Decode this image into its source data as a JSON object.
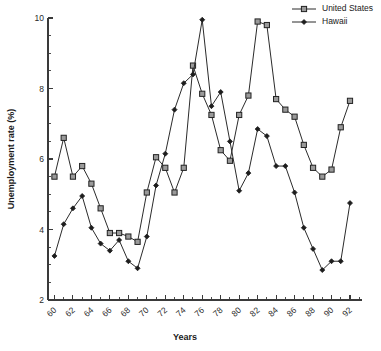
{
  "chart_data": {
    "type": "line",
    "title": "",
    "xlabel": "Years",
    "ylabel": "Unemployment rate (%)",
    "xlim": [
      59.3,
      93.3
    ],
    "ylim": [
      2,
      10
    ],
    "grid": false,
    "legend_position": "top-right",
    "y_ticks_major": [
      2,
      4,
      6,
      8,
      10
    ],
    "y_ticks_minor": [
      2.5,
      3,
      3.5,
      4.5,
      5,
      5.5,
      6.5,
      7,
      7.5,
      8.5,
      9,
      9.5
    ],
    "x_ticks_major": [
      60,
      62,
      64,
      66,
      68,
      70,
      72,
      74,
      76,
      78,
      80,
      82,
      84,
      86,
      88,
      90,
      92
    ],
    "x_ticks_minor": [
      61,
      63,
      65,
      67,
      69,
      71,
      73,
      75,
      77,
      79,
      81,
      83,
      85,
      87,
      89,
      91,
      93
    ],
    "x_tick_labels": [
      "60",
      "62",
      "64",
      "66",
      "68",
      "70",
      "72",
      "74",
      "76",
      "78",
      "80",
      "82",
      "84",
      "86",
      "88",
      "90",
      "92"
    ],
    "y_tick_labels": [
      "2",
      "4",
      "6",
      "8",
      "10"
    ],
    "x": [
      60,
      61,
      62,
      63,
      64,
      65,
      66,
      67,
      68,
      69,
      70,
      71,
      72,
      73,
      74,
      75,
      76,
      77,
      78,
      79,
      80,
      81,
      82,
      83,
      84,
      85,
      86,
      87,
      88,
      89,
      90,
      91,
      92,
      93
    ],
    "series": [
      {
        "name": "United States",
        "marker": "square",
        "marker_fill": "#9a9a9a",
        "color": "#2b2b2b",
        "values": [
          5.5,
          6.6,
          5.5,
          5.8,
          5.3,
          4.6,
          3.9,
          3.9,
          3.8,
          3.65,
          5.05,
          6.05,
          5.75,
          5.05,
          5.75,
          8.65,
          7.85,
          7.25,
          6.25,
          5.95,
          7.25,
          7.8,
          9.9,
          9.8,
          7.7,
          7.4,
          7.2,
          6.4,
          5.75,
          5.5,
          5.7,
          6.9,
          7.65,
          null
        ]
      },
      {
        "name": "Hawaii",
        "marker": "diamond",
        "marker_fill": "#1d1d1d",
        "color": "#2b2b2b",
        "values": [
          3.25,
          4.15,
          4.6,
          4.95,
          4.05,
          3.6,
          3.4,
          3.7,
          3.1,
          2.9,
          3.8,
          5.25,
          6.15,
          7.4,
          8.15,
          8.4,
          9.95,
          7.5,
          7.9,
          6.5,
          5.1,
          5.6,
          6.85,
          6.65,
          5.8,
          5.8,
          5.05,
          4.05,
          3.45,
          2.85,
          3.1,
          3.1,
          4.75,
          null
        ]
      }
    ]
  },
  "legend": {
    "entries": [
      {
        "label": "United States",
        "marker": "square"
      },
      {
        "label": "Hawaii",
        "marker": "diamond"
      }
    ]
  }
}
